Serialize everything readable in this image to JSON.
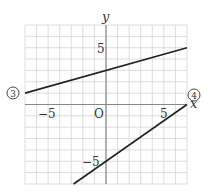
{
  "chart_data": {
    "type": "line",
    "title": "",
    "xlabel": "x",
    "ylabel": "y",
    "xlim": [
      -7,
      7
    ],
    "ylim": [
      -7,
      7
    ],
    "grid": true,
    "origin_label": "O",
    "x_ticks": [
      {
        "value": -5,
        "label": "−5"
      },
      {
        "value": 5,
        "label": "5"
      }
    ],
    "y_ticks": [
      {
        "value": 5,
        "label": "5"
      },
      {
        "value": -5,
        "label": "−5"
      }
    ],
    "series": [
      {
        "name": "③",
        "equation": "y = 2/7 x + 3",
        "points": [
          [
            -7,
            1
          ],
          [
            7,
            5
          ]
        ]
      },
      {
        "name": "④",
        "equation": "y = 5/7 x − 5",
        "points": [
          [
            -2.8,
            -7
          ],
          [
            7,
            0
          ]
        ]
      }
    ]
  },
  "labels": {
    "x_axis": "x",
    "y_axis": "y",
    "origin": "O",
    "tick_x_neg5": "−5",
    "tick_x_5": "5",
    "tick_y_5": "5",
    "tick_y_neg5": "−5",
    "line3": "3",
    "line4": "4"
  }
}
